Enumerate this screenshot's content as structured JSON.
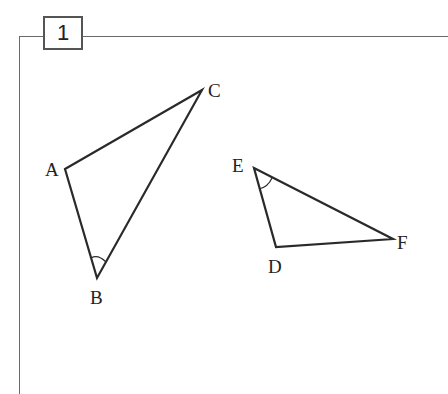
{
  "problem": {
    "number": "1"
  },
  "figures": {
    "triangle_abc": {
      "vertices": {
        "A": {
          "label": "A",
          "x": 65,
          "y": 169
        },
        "B": {
          "label": "B",
          "x": 97,
          "y": 278
        },
        "C": {
          "label": "C",
          "x": 202,
          "y": 90
        }
      },
      "marked_angle": "B"
    },
    "triangle_def": {
      "vertices": {
        "D": {
          "label": "D",
          "x": 276,
          "y": 247
        },
        "E": {
          "label": "E",
          "x": 254,
          "y": 168
        },
        "F": {
          "label": "F",
          "x": 393,
          "y": 239
        }
      },
      "marked_angle": "E"
    }
  },
  "colors": {
    "stroke": "#2a2a2a",
    "frame": "#6a6a6a"
  }
}
